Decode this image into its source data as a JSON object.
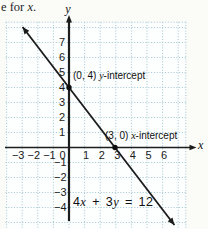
{
  "page": {
    "top_text": {
      "prefix": "e for ",
      "var": "x",
      "suffix": "."
    }
  },
  "graph": {
    "y_axis_label": "y",
    "x_axis_label": "x",
    "y_intercept_annotation": {
      "point": "(0, 4) ",
      "var": "y",
      "suffix": "-intercept"
    },
    "x_intercept_annotation": {
      "point": "(3, 0) ",
      "var": "x",
      "suffix": "-intercept"
    },
    "equation": {
      "p1": "4",
      "v1": "x",
      "p2": " + 3",
      "v2": "y",
      "p3": " = 12"
    }
  },
  "chart_data": {
    "type": "line",
    "title": "",
    "xlabel": "x",
    "ylabel": "y",
    "xlim": [
      -4,
      7.5
    ],
    "ylim": [
      -5.5,
      8.3
    ],
    "x_ticks": [
      -3,
      -2,
      -1,
      0,
      1,
      2,
      3,
      4,
      5,
      6
    ],
    "y_ticks": [
      7,
      6,
      5,
      4,
      3,
      2,
      1,
      -1,
      -2,
      -3,
      -4
    ],
    "grid": true,
    "grid_color": "#a3c6d1",
    "line_color": "#1b1b1b",
    "equation": "4x + 3y = 12",
    "slope": -1.3333,
    "x_intercept": [
      3,
      0
    ],
    "y_intercept": [
      0,
      4
    ],
    "series": [
      {
        "name": "4x + 3y = 12",
        "points": [
          [
            -3.5,
            8.7
          ],
          [
            0,
            4
          ],
          [
            3,
            0
          ],
          [
            7.2,
            -5.6
          ]
        ]
      }
    ],
    "annotations": [
      {
        "text": "(0, 4) y-intercept",
        "at": [
          0,
          4
        ]
      },
      {
        "text": "(3, 0) x-intercept",
        "at": [
          3,
          0
        ]
      },
      {
        "text": "4x + 3y = 12",
        "at": [
          0.3,
          -3.3
        ]
      }
    ]
  }
}
